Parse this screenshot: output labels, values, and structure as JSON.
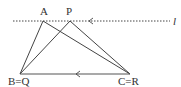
{
  "diagram": {
    "type": "geometry",
    "line_label": "l",
    "line_style": "dotted",
    "colors": {
      "stroke": "#444444",
      "label": "#333333",
      "background": "#ffffff"
    },
    "points": {
      "A": {
        "label": "A",
        "x": 43,
        "y": 21
      },
      "P": {
        "label": "P",
        "x": 70,
        "y": 21
      },
      "B": {
        "label": "B=Q",
        "x": 20,
        "y": 74
      },
      "C": {
        "label": "C=R",
        "x": 130,
        "y": 74
      }
    },
    "segments": [
      [
        "A",
        "B"
      ],
      [
        "A",
        "C"
      ],
      [
        "P",
        "B"
      ],
      [
        "P",
        "C"
      ],
      [
        "B",
        "C"
      ]
    ],
    "arrows": [
      {
        "on": "line-l",
        "direction": "left"
      },
      {
        "on": "segment-BC",
        "direction": "left"
      }
    ]
  }
}
